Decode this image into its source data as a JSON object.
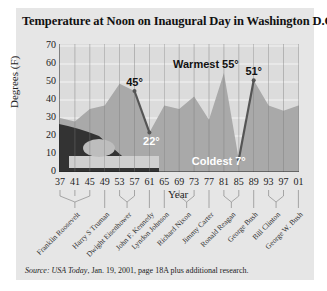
{
  "title": "Temperature at Noon on Inaugural Day in Washington D.C.",
  "source": {
    "prefix": "Source:",
    "publication": "USA Today",
    "rest": ", Jan. 19, 2001, page 18A plus additional research."
  },
  "annotations": {
    "a45": "45°",
    "a22": "22°",
    "warmest": "Warmest 55°",
    "a51": "51°",
    "coldest": "Coldest 7°"
  },
  "colors": {
    "panel": "#e6e6e6",
    "plot_bg": "#dcdcdc",
    "area": "#a9a9a9",
    "line": "#555555",
    "annotation_white": "#ffffff"
  },
  "chart_data": {
    "type": "area",
    "title": "Temperature at Noon on Inaugural Day in Washington D.C.",
    "xlabel": "Year",
    "ylabel": "Degrees (F)",
    "ylim": [
      0,
      70
    ],
    "yticks": [
      "0",
      "10",
      "20",
      "30",
      "40",
      "50",
      "60",
      "70"
    ],
    "categories": [
      "37",
      "41",
      "45",
      "49",
      "53",
      "57",
      "61",
      "65",
      "69",
      "73",
      "77",
      "81",
      "85",
      "89",
      "93",
      "97",
      "01"
    ],
    "values": [
      30,
      28,
      35,
      37,
      49,
      45,
      22,
      37,
      35,
      42,
      29,
      55,
      7,
      51,
      37,
      34,
      37
    ],
    "highlighted_segments": [
      {
        "from": "57",
        "to": "61",
        "labels": [
          "45°",
          "22°"
        ]
      },
      {
        "from": "85",
        "to": "89",
        "labels": [
          "7°",
          "51°"
        ]
      }
    ],
    "annotations": [
      "45°",
      "22°",
      "Warmest 55°",
      "51°",
      "Coldest 7°"
    ],
    "presidents": [
      {
        "name": "Franklin Roosevelt",
        "years": [
          "37",
          "41",
          "45"
        ]
      },
      {
        "name": "Harry S Truman",
        "years": [
          "49"
        ]
      },
      {
        "name": "Dwight Eisenhower",
        "years": [
          "53",
          "57"
        ]
      },
      {
        "name": "John F. Kennedy",
        "years": [
          "61"
        ]
      },
      {
        "name": "Lyndon Johnson",
        "years": [
          "65"
        ]
      },
      {
        "name": "Richard Nixon",
        "years": [
          "69",
          "73"
        ]
      },
      {
        "name": "Jimmy Carter",
        "years": [
          "77"
        ]
      },
      {
        "name": "Ronald Reagan",
        "years": [
          "81",
          "85"
        ]
      },
      {
        "name": "George Bush",
        "years": [
          "89"
        ]
      },
      {
        "name": "Bill Clinton",
        "years": [
          "93",
          "97"
        ]
      },
      {
        "name": "George W. Bush",
        "years": [
          "01"
        ]
      }
    ],
    "grid": true,
    "legend": "none"
  }
}
